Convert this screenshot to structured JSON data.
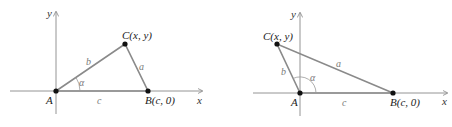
{
  "colors": {
    "axis": "#888888",
    "triangle": "#8a8a8a",
    "point": "#111111",
    "label": "#222222",
    "side_label": "#7a7a7a"
  },
  "diagrams": [
    {
      "name": "acute-angle-triangle",
      "axes": {
        "x_label": "x",
        "y_label": "y"
      },
      "points": {
        "A": "A",
        "B": "B(c, 0)",
        "C": "C(x, y)"
      },
      "sides": {
        "a": "a",
        "b": "b",
        "c": "c"
      },
      "angle": "α"
    },
    {
      "name": "obtuse-angle-triangle",
      "axes": {
        "x_label": "x",
        "y_label": "y"
      },
      "points": {
        "A": "A",
        "B": "B(c, 0)",
        "C": "C(x, y)"
      },
      "sides": {
        "a": "a",
        "b": "b",
        "c": "c"
      },
      "angle": "α"
    }
  ]
}
